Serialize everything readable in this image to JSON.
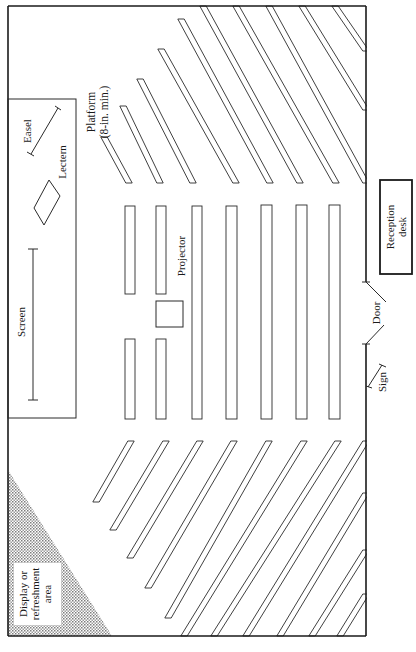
{
  "diagram": {
    "colors": {
      "ink": "#1a1a1a",
      "line": "#2a2a2a",
      "paper": "#ffffff",
      "stipple": "#9a9a9a"
    },
    "room": {
      "x": 8,
      "y": 6,
      "w": 358,
      "h": 630
    },
    "platform": {
      "x": 8,
      "y": 99,
      "w": 68,
      "h": 319
    },
    "labels": {
      "platform": "Platform",
      "platform_note": "(8-in. min.)",
      "easel": "Easel",
      "lectern": "Lectern",
      "screen": "Screen",
      "projector": "Projector",
      "reception_line1": "Reception",
      "reception_line2": "desk",
      "door": "Door",
      "sign": "Sign",
      "display_line1": "Display or",
      "display_line2": "refreshment",
      "display_line3": "area"
    },
    "reception_desk": {
      "x": 380,
      "y": 180,
      "w": 32,
      "h": 94
    },
    "projector_box": {
      "x": 156,
      "y": 301,
      "w": 27,
      "h": 26
    },
    "center_rows": [
      {
        "x": 125,
        "w": 10,
        "segments": [
          [
            206,
            294
          ],
          [
            339,
            419
          ]
        ]
      },
      {
        "x": 156,
        "w": 10,
        "segments": [
          [
            206,
            294
          ],
          [
            339,
            419
          ]
        ]
      },
      {
        "x": 192,
        "w": 10,
        "segments": [
          [
            206,
            419
          ]
        ]
      },
      {
        "x": 226,
        "w": 11,
        "segments": [
          [
            206,
            419
          ]
        ]
      },
      {
        "x": 261,
        "w": 11,
        "segments": [
          [
            205,
            419
          ]
        ]
      },
      {
        "x": 296,
        "w": 11,
        "segments": [
          [
            205,
            419
          ]
        ]
      },
      {
        "x": 329,
        "w": 11,
        "segments": [
          [
            205,
            419
          ]
        ]
      }
    ],
    "top_benches": [
      {
        "x1": 104,
        "y1": 137,
        "x2": 129,
        "y2": 183
      },
      {
        "x1": 123,
        "y1": 106,
        "x2": 160,
        "y2": 183
      },
      {
        "x1": 140,
        "y1": 79,
        "x2": 193,
        "y2": 183
      },
      {
        "x1": 161,
        "y1": 49,
        "x2": 236,
        "y2": 183
      },
      {
        "x1": 181,
        "y1": 19,
        "x2": 270,
        "y2": 183
      },
      {
        "x1": 203,
        "y1": 6,
        "x2": 300,
        "y2": 183
      },
      {
        "x1": 236,
        "y1": 6,
        "x2": 336,
        "y2": 183
      },
      {
        "x1": 269,
        "y1": 6,
        "x2": 366,
        "y2": 183
      },
      {
        "x1": 302,
        "y1": 6,
        "x2": 366,
        "y2": 110
      },
      {
        "x1": 335,
        "y1": 6,
        "x2": 366,
        "y2": 51
      }
    ],
    "bottom_benches": [
      {
        "x1": 96,
        "y1": 502,
        "x2": 131,
        "y2": 441
      },
      {
        "x1": 113,
        "y1": 530,
        "x2": 166,
        "y2": 441
      },
      {
        "x1": 130,
        "y1": 558,
        "x2": 200,
        "y2": 441
      },
      {
        "x1": 148,
        "y1": 588,
        "x2": 234,
        "y2": 441
      },
      {
        "x1": 168,
        "y1": 618,
        "x2": 269,
        "y2": 441
      },
      {
        "x1": 184,
        "y1": 636,
        "x2": 304,
        "y2": 441
      },
      {
        "x1": 214,
        "y1": 636,
        "x2": 338,
        "y2": 441
      },
      {
        "x1": 246,
        "y1": 636,
        "x2": 366,
        "y2": 441
      },
      {
        "x1": 280,
        "y1": 636,
        "x2": 366,
        "y2": 493
      },
      {
        "x1": 312,
        "y1": 636,
        "x2": 366,
        "y2": 550
      },
      {
        "x1": 340,
        "y1": 636,
        "x2": 366,
        "y2": 594
      }
    ]
  }
}
